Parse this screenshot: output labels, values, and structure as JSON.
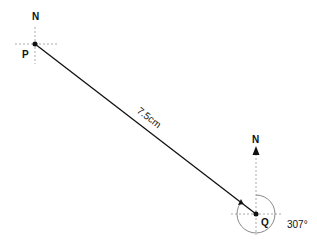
{
  "diagram": {
    "type": "bearing-diagram",
    "points": {
      "P": {
        "label": "P",
        "north_label": "N"
      },
      "Q": {
        "label": "Q",
        "north_label": "N"
      }
    },
    "distance_label": "7.5cm",
    "bearing_label": "307°",
    "colors": {
      "line": "#111111",
      "guide": "#aaaaaa",
      "arc": "#888888"
    }
  }
}
